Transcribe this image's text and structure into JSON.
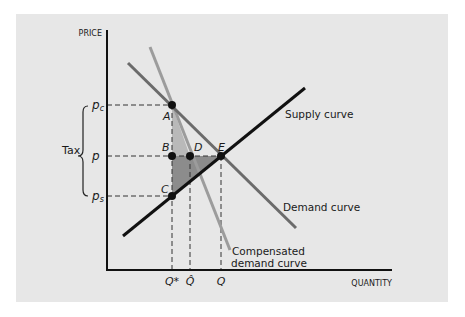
{
  "diagram": {
    "y_axis_label": "PRICE",
    "x_axis_label": "QUANTITY",
    "price_labels": {
      "pc": {
        "base": "p",
        "sub": "c"
      },
      "p": {
        "base": "p",
        "sub": ""
      },
      "ps": {
        "base": "p",
        "sub": "s"
      }
    },
    "tax_label": "Tax",
    "quantity_labels": {
      "qstar": "Q*",
      "qhat": "Q̂",
      "q": "Q"
    },
    "points": {
      "A": "A",
      "B": "B",
      "C": "C",
      "D": "D",
      "E": "E"
    },
    "curves": {
      "supply": "Supply curve",
      "demand": "Demand curve",
      "compensated_line1": "Compensated",
      "compensated_line2": "demand curve"
    },
    "colors": {
      "panel": "#e7e7e7",
      "supply": "#111111",
      "demand": "#6b6b6b",
      "compensated": "#9c9c9c",
      "shade_light": "#b9b9b9",
      "shade_dark": "#8c8c8c"
    }
  }
}
